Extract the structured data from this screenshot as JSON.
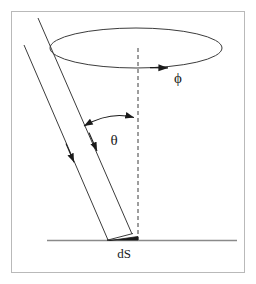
{
  "figure": {
    "background_color": "#ffffff",
    "border": {
      "name": "figure-frame",
      "color": "#b9b9b9",
      "x": 11,
      "y": 11,
      "width": 233,
      "height": 261,
      "stroke_width": 1
    },
    "line_color": "#3c3c3c",
    "dash_color": "#3c3c3c",
    "surface_color": "#8a8a8a",
    "fill_color": "#1a1a1a",
    "labels": [
      {
        "id": "phi",
        "name": "phi-label",
        "text": "ϕ",
        "x": 178,
        "y": 83,
        "font_size": 15
      },
      {
        "id": "theta",
        "name": "theta-label",
        "text": "θ",
        "x": 114,
        "y": 145,
        "font_size": 15
      },
      {
        "id": "dS",
        "name": "ds-label",
        "text": "dS",
        "x": 124,
        "y": 258,
        "font_size": 13
      }
    ],
    "ellipse": {
      "name": "azimuth-ellipse",
      "cx": 136,
      "cy": 48,
      "rx": 86,
      "ry": 20,
      "stroke_width": 1
    },
    "axis": {
      "name": "vertical-axis-dashed",
      "x": 138,
      "y_top": 48,
      "y_bottom": 240,
      "dash_pattern": "4 3",
      "stroke_width": 1
    },
    "surface_line": {
      "name": "surface-line",
      "x1": 47,
      "y1": 240,
      "x2": 237,
      "y2": 240,
      "stroke_width": 1.4
    },
    "cone_lines": [
      {
        "name": "cone-edge-left",
        "x1": 24,
        "y1": 45,
        "x2": 108,
        "y2": 240,
        "arrow_at": {
          "x": 73,
          "y": 159
        }
      },
      {
        "name": "cone-edge-right",
        "x1": 38,
        "y1": 18,
        "x2": 132,
        "y2": 234,
        "arrow_at": {
          "x": 96,
          "y": 148
        }
      }
    ],
    "theta_arc": {
      "name": "theta-angle-arc",
      "start_x": 82,
      "start_y": 125,
      "end_x": 136,
      "end_y": 117,
      "control_x": 110,
      "control_y": 112,
      "double_headed": true
    },
    "phi_arrow": {
      "name": "phi-direction-arrow",
      "x": 168,
      "y": 67,
      "direction": "right"
    },
    "surface_element": {
      "name": "ds-patch",
      "points": "108,240 138,240 138,236 112,241",
      "edge_x1": 108,
      "edge_y1": 240,
      "edge_x2": 132,
      "edge_y2": 234
    }
  }
}
